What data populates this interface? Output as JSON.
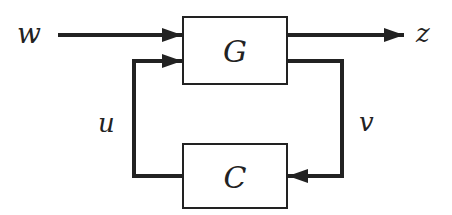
{
  "diagram": {
    "type": "feedback-block-diagram",
    "blocks": [
      {
        "id": "plant",
        "label": "G"
      },
      {
        "id": "controller",
        "label": "C"
      }
    ],
    "signals": {
      "w": "w",
      "z": "z",
      "u": "u",
      "v": "v"
    },
    "colors": {
      "stroke": "#222222",
      "background": "#ffffff"
    }
  }
}
